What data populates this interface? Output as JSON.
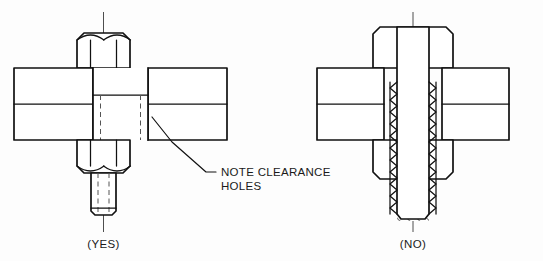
{
  "figure": {
    "background_color": "#fdfdfd",
    "line_color": "#111111",
    "centerline_color": "#3a3a3a",
    "hidden_line_color": "#555555"
  },
  "annotations": {
    "note_line1": "NOTE CLEARANCE",
    "note_line2": "HOLES",
    "leader_name": "leader-line-to-clearance-hole"
  },
  "panels": [
    {
      "id": "left",
      "caption": "(YES)",
      "meaning": "correct-practice",
      "description": "Bolt shown with clearance holes in the plates"
    },
    {
      "id": "right",
      "caption": "(NO)",
      "meaning": "incorrect-practice",
      "description": "Bolt shown threaded through plates without clearance"
    }
  ],
  "components": {
    "left": {
      "top_nut": "hex-nut-top",
      "bottom_nut": "hex-nut-bottom",
      "bolt_shank": "bolt-shank",
      "bolt_end": "bolt-threaded-end",
      "upper_plate": "upper-plate-section",
      "lower_plate": "lower-plate-section",
      "clearance_hole": "clearance-hole-hidden-edges",
      "centerline": "vertical-centerline"
    },
    "right": {
      "top_nut": "hex-nut-top",
      "bottom_nut": "hex-nut-bottom",
      "bolt_shank": "threaded-bolt-shank",
      "upper_plate": "upper-plate-section",
      "lower_plate": "lower-plate-section",
      "thread_profile": "thread-zigzag-profile",
      "centerline": "vertical-centerline"
    }
  }
}
